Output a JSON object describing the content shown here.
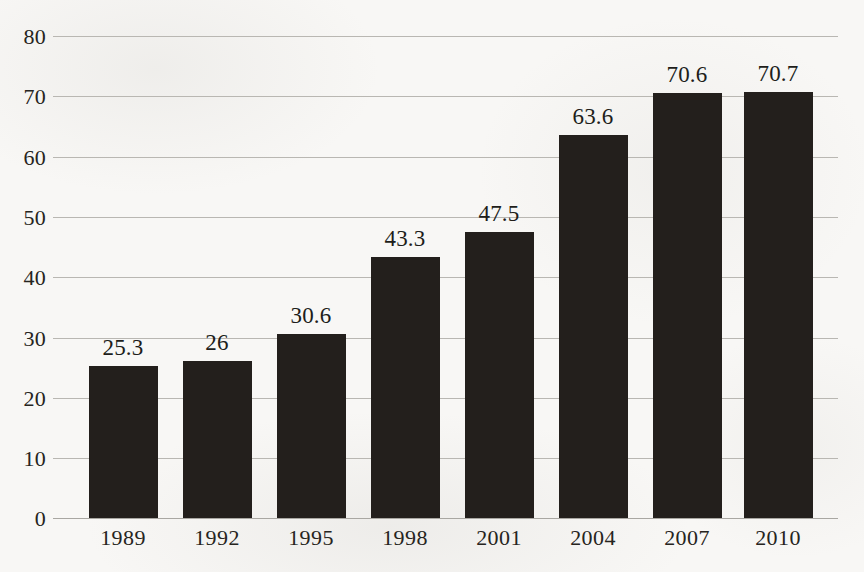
{
  "chart_data": {
    "type": "bar",
    "title": "",
    "subtitle": "",
    "xlabel": "",
    "ylabel": "",
    "categories": [
      "1989",
      "1992",
      "1995",
      "1998",
      "2001",
      "2004",
      "2007",
      "2010"
    ],
    "values": [
      25.3,
      26,
      30.6,
      43.3,
      47.5,
      63.6,
      70.6,
      70.7
    ],
    "value_labels": [
      "25.3",
      "26",
      "30.6",
      "43.3",
      "47.5",
      "63.6",
      "70.6",
      "70.7"
    ],
    "ylim": [
      0,
      80
    ],
    "ytick_labels": [
      "0",
      "10",
      "20",
      "30",
      "40",
      "50",
      "60",
      "70",
      "80"
    ],
    "ytick_values": [
      0,
      10,
      20,
      30,
      40,
      50,
      60,
      70,
      80
    ],
    "grid": "horizontal",
    "legend": "none",
    "bar_color": "#231f1c",
    "gridline_color": "#b9b7b2",
    "background_color": "#f8f7f5",
    "text_color": "#262420"
  }
}
